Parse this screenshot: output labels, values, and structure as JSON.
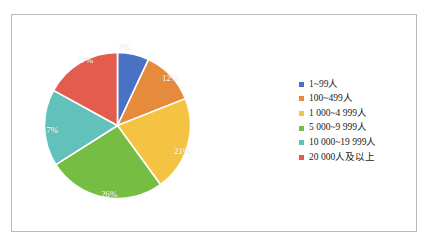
{
  "chart_data": {
    "type": "pie",
    "title": "",
    "categories": [
      "1~99人",
      "100~499人",
      "1 000~4 999人",
      "5 000~9 999人",
      "10 000~19 999人",
      "20 000人及以上"
    ],
    "values": [
      7,
      12,
      21,
      26,
      17,
      17
    ],
    "data_labels": [
      "7%",
      "12%",
      "21%",
      "26%",
      "17%",
      "17%"
    ],
    "colors": [
      "#4a72c4",
      "#e68a3c",
      "#f5c342",
      "#76bd44",
      "#62c2bb",
      "#e35c4e"
    ],
    "legend_position": "right",
    "start_angle_deg": 0,
    "direction": "clockwise",
    "slice_separator_color": "#ffffff",
    "grid": false
  },
  "slices": [
    {
      "label": "7%",
      "color": "#4a72c4",
      "value": 7,
      "label_x": 124,
      "label_y": 47
    },
    {
      "label": "12%",
      "color": "#e68a3c",
      "value": 12,
      "label_x": 170,
      "label_y": 78
    },
    {
      "label": "21%",
      "color": "#f5c342",
      "value": 21,
      "label_x": 182,
      "label_y": 151
    },
    {
      "label": "26%",
      "color": "#76bd44",
      "value": 26,
      "label_x": 109,
      "label_y": 194
    },
    {
      "label": "17%",
      "color": "#62c2bb",
      "value": 17,
      "label_x": 50,
      "label_y": 130
    },
    {
      "label": "17%",
      "color": "#e35c4e",
      "value": 17,
      "label_x": 85,
      "label_y": 60
    }
  ],
  "legend": {
    "items": [
      {
        "label": "1~99人",
        "color": "#4a72c4"
      },
      {
        "label": "100~499人",
        "color": "#e68a3c"
      },
      {
        "label": "1 000~4 999人",
        "color": "#f5c342"
      },
      {
        "label": "5 000~9 999人",
        "color": "#76bd44"
      },
      {
        "label": "10 000~19 999人",
        "color": "#62c2bb"
      },
      {
        "label": "20 000人及以上",
        "color": "#e35c4e"
      }
    ]
  },
  "frame": {
    "border_color": "#b9b9b9",
    "background": "#ffffff"
  }
}
